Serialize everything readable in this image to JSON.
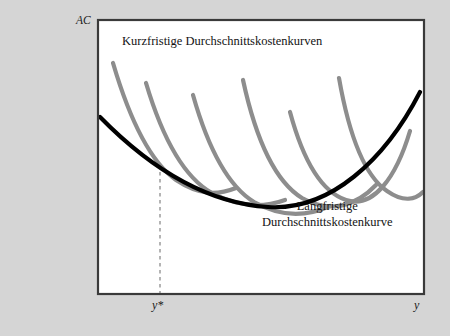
{
  "figure": {
    "background_color": "#d5d5d5",
    "plot_background_color": "#ffffff",
    "frame_color": "#3a3a3a",
    "short_run_curve_color": "#8d8d8d",
    "long_run_curve_color": "#000000",
    "dashed_line_color": "#777777"
  },
  "axes": {
    "y_axis_label": "AC",
    "x_axis_label": "y",
    "x_marker_label": "y*"
  },
  "annotations": {
    "short_run": {
      "line1": "Kurzfristige",
      "line2": "Durchschnittskostenkurven"
    },
    "long_run": {
      "line1": "Langfristige",
      "line2": "Durchschnittskostenkurve"
    }
  },
  "chart_data": {
    "type": "line",
    "title": "",
    "xlabel": "y",
    "ylabel": "AC",
    "grid": false,
    "legend_position": "none",
    "axis_origin_px": {
      "x": 98,
      "y": 294
    },
    "plot_rect_px": {
      "x": 98,
      "y": 20,
      "width": 326,
      "height": 274
    },
    "marker_x_px": 160,
    "marker_label": "y*",
    "tangency_point_px": {
      "x": 160,
      "y": 172
    },
    "series": [
      {
        "name": "Langfristige Durchschnittskostenkurve",
        "role": "long-run-envelope",
        "color": "#000000",
        "stroke_width": 4.2,
        "path": "M 100,117 C 150,168 205,203 268,207 C 330,211 385,160 420,92"
      },
      {
        "name": "Kurzfristige Durchschnittskostenkurve 1",
        "role": "short-run",
        "color": "#8d8d8d",
        "stroke_width": 4.2,
        "path": "M 113,63 C 131,124 152,163 176,180 C 200,196 218,195 236,188"
      },
      {
        "name": "Kurzfristige Durchschnittskostenkurve 2",
        "role": "short-run",
        "color": "#8d8d8d",
        "stroke_width": 4.2,
        "path": "M 146,83 C 163,140 185,178 212,193 C 240,208 263,208 285,200"
      },
      {
        "name": "Kurzfristige Durchschnittskostenkurve 3",
        "role": "short-run",
        "color": "#8d8d8d",
        "stroke_width": 4.2,
        "path": "M 193,95 C 208,148 228,186 254,202 C 282,218 308,216 330,206"
      },
      {
        "name": "Kurzfristige Durchschnittskostenkurve 4",
        "role": "short-run",
        "color": "#8d8d8d",
        "stroke_width": 4.2,
        "path": "M 243,80 C 256,140 276,182 302,198 C 330,214 356,206 376,185"
      },
      {
        "name": "Kurzfristige Durchschnittskostenkurve 5",
        "role": "short-run",
        "color": "#8d8d8d",
        "stroke_width": 4.2,
        "path": "M 290,112 C 303,160 322,192 346,200 C 373,209 396,178 410,131"
      },
      {
        "name": "Kurzfristige Durchschnittskostenkurve 6",
        "role": "short-run",
        "color": "#8d8d8d",
        "stroke_width": 4.2,
        "path": "M 339,78 C 349,135 365,176 387,191 C 404,203 416,199 423,192"
      }
    ]
  }
}
